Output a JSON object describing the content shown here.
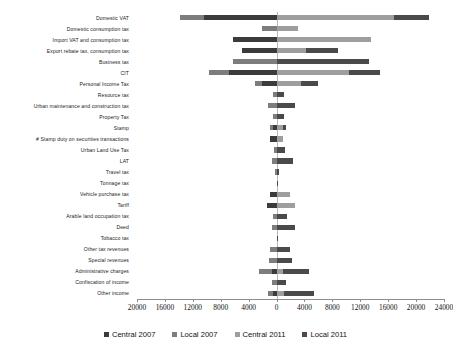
{
  "chart_data": {
    "type": "bar",
    "subtype": "diverging-stacked-horizontal",
    "title": "",
    "xlabel": "",
    "ylabel": "",
    "grid": false,
    "legend_position": "bottom",
    "xlim": [
      -20000,
      24000
    ],
    "xtick_step": 4000,
    "xticks": [
      -20000,
      -16000,
      -12000,
      -8000,
      -4000,
      0,
      4000,
      8000,
      12000,
      16000,
      20000,
      24000
    ],
    "xtick_labels": [
      "20000",
      "16000",
      "12000",
      "8000",
      "4000",
      "0",
      "4000",
      "8000",
      "12000",
      "16000",
      "20000",
      "24000"
    ],
    "note_left_side": "2007 values plotted to the left of zero",
    "note_right_side": "2011 values plotted to the right of zero",
    "categories": [
      "Domestic VAT",
      "Domestic consumption tax",
      "Import VAT and consumption tax",
      "Export rebate tax, consumption tax",
      "Business tax",
      "CIT",
      "Personal Income Tax",
      "Resource tax",
      "Urban maintenance and construction tax",
      "Property Tax",
      "Stamp",
      "# Stamp duty on securities transactions",
      "Urban Land Use Tax",
      "LAT",
      "Travel tax",
      "Tonnage tax",
      "Vehicle purchase tax",
      "Tariff",
      "Arable land occupation tax",
      "Deed",
      "Tobacco tax",
      "Other tax revenues",
      "Special revenues",
      "Administrative charges",
      "Confiscation of income",
      "Other income"
    ],
    "series": [
      {
        "name": "Central 2007",
        "color": "#3b3b3b",
        "side": "left",
        "values": [
          10360,
          0,
          6240,
          4900,
          0,
          6850,
          2100,
          0,
          0,
          0,
          560,
          1000,
          0,
          0,
          0,
          0,
          880,
          1430,
          0,
          0,
          0,
          0,
          0,
          620,
          0,
          520
        ]
      },
      {
        "name": "Local 2007",
        "color": "#7d7d7d",
        "side": "left",
        "values": [
          3500,
          2100,
          0,
          0,
          6200,
          2900,
          1000,
          580,
          1180,
          580,
          320,
          0,
          385,
          700,
          170,
          0,
          0,
          0,
          540,
          690,
          0,
          880,
          1150,
          1900,
          700,
          700
        ]
      },
      {
        "name": "Central 2011",
        "color": "#9e9e9e",
        "side": "right",
        "values": [
          16800,
          3100,
          13600,
          4200,
          0,
          10400,
          3500,
          0,
          0,
          0,
          860,
          990,
          0,
          0,
          0,
          0,
          2000,
          2700,
          0,
          0,
          0,
          0,
          0,
          900,
          0,
          1100
        ]
      },
      {
        "name": "Local 2011",
        "color": "#4a4a4a",
        "side": "right",
        "values": [
          5000,
          0,
          0,
          4650,
          13200,
          4400,
          2400,
          1000,
          2700,
          1100,
          520,
          0,
          1200,
          2400,
          420,
          230,
          0,
          0,
          1450,
          2700,
          180,
          1900,
          2200,
          3700,
          1400,
          4300
        ]
      }
    ]
  },
  "legend": {
    "items": [
      {
        "label": "Central 2007",
        "color": "#3b3b3b"
      },
      {
        "label": "Local 2007",
        "color": "#7d7d7d"
      },
      {
        "label": "Central 2011",
        "color": "#9e9e9e"
      },
      {
        "label": "Local 2011",
        "color": "#4a4a4a"
      }
    ]
  }
}
